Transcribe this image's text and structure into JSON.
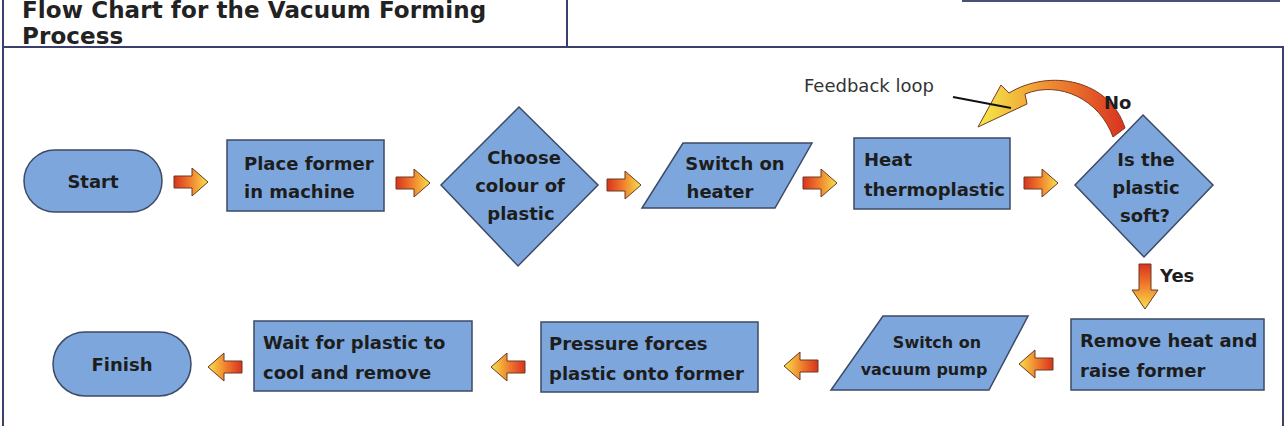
{
  "title": "Flow Chart for the Vacuum Forming Process",
  "colors": {
    "shape_fill": "#7da7dc",
    "shape_stroke": "#3c4a66",
    "frame": "#3a3f6e",
    "arrow_dark": "#e0402a",
    "arrow_light": "#f6e046"
  },
  "nodes": [
    {
      "id": "start",
      "shape": "terminator",
      "lines": [
        "Start"
      ]
    },
    {
      "id": "place-former",
      "shape": "process",
      "lines": [
        "Place former",
        "in machine"
      ]
    },
    {
      "id": "choose-colour",
      "shape": "decision",
      "lines": [
        "Choose",
        "colour of",
        "plastic"
      ]
    },
    {
      "id": "switch-heater",
      "shape": "input-output",
      "lines": [
        "Switch on",
        "heater"
      ]
    },
    {
      "id": "heat-thermoplastic",
      "shape": "process",
      "lines": [
        "Heat",
        "thermoplastic"
      ]
    },
    {
      "id": "is-soft",
      "shape": "decision",
      "lines": [
        "Is the",
        "plastic",
        "soft?"
      ]
    },
    {
      "id": "remove-heat",
      "shape": "process",
      "lines": [
        "Remove heat and",
        "raise former"
      ]
    },
    {
      "id": "switch-vacuum",
      "shape": "input-output",
      "lines": [
        "Switch on",
        "vacuum pump"
      ]
    },
    {
      "id": "pressure-forces",
      "shape": "process",
      "lines": [
        "Pressure forces",
        "plastic onto former"
      ]
    },
    {
      "id": "wait-cool",
      "shape": "process",
      "lines": [
        "Wait for plastic to",
        "cool and remove"
      ]
    },
    {
      "id": "finish",
      "shape": "terminator",
      "lines": [
        "Finish"
      ]
    }
  ],
  "edges": [
    {
      "from": "start",
      "to": "place-former"
    },
    {
      "from": "place-former",
      "to": "choose-colour"
    },
    {
      "from": "choose-colour",
      "to": "switch-heater"
    },
    {
      "from": "switch-heater",
      "to": "heat-thermoplastic"
    },
    {
      "from": "heat-thermoplastic",
      "to": "is-soft"
    },
    {
      "from": "is-soft",
      "to": "heat-thermoplastic",
      "label": "No"
    },
    {
      "from": "is-soft",
      "to": "remove-heat",
      "label": "Yes"
    },
    {
      "from": "remove-heat",
      "to": "switch-vacuum"
    },
    {
      "from": "switch-vacuum",
      "to": "pressure-forces"
    },
    {
      "from": "pressure-forces",
      "to": "wait-cool"
    },
    {
      "from": "wait-cool",
      "to": "finish"
    }
  ],
  "annotations": {
    "feedback_loop": "Feedback loop",
    "no_label": "No",
    "yes_label": "Yes"
  }
}
